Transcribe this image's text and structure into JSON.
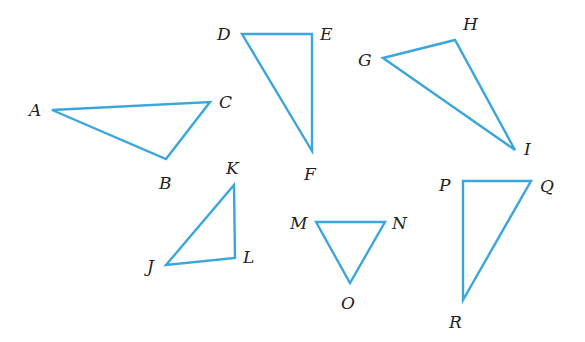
{
  "figure": {
    "width": 585,
    "height": 342,
    "stroke_color": "#3aa6dd",
    "label_color": "#222222",
    "triangles": [
      {
        "name": "ABC",
        "vertices": [
          {
            "label": "A",
            "x": 52,
            "y": 110,
            "lx": 29,
            "ly": 116
          },
          {
            "label": "C",
            "x": 210,
            "y": 102,
            "lx": 219,
            "ly": 108
          },
          {
            "label": "B",
            "x": 166,
            "y": 159,
            "lx": 159,
            "ly": 189
          }
        ]
      },
      {
        "name": "DEF",
        "vertices": [
          {
            "label": "D",
            "x": 242,
            "y": 34,
            "lx": 217,
            "ly": 40
          },
          {
            "label": "E",
            "x": 312,
            "y": 34,
            "lx": 320,
            "ly": 40
          },
          {
            "label": "F",
            "x": 312,
            "y": 151,
            "lx": 304,
            "ly": 180
          }
        ]
      },
      {
        "name": "GHI",
        "vertices": [
          {
            "label": "G",
            "x": 383,
            "y": 58,
            "lx": 358,
            "ly": 66
          },
          {
            "label": "H",
            "x": 455,
            "y": 40,
            "lx": 463,
            "ly": 30
          },
          {
            "label": "I",
            "x": 515,
            "y": 150,
            "lx": 524,
            "ly": 155
          }
        ]
      },
      {
        "name": "JKL",
        "vertices": [
          {
            "label": "K",
            "x": 234,
            "y": 185,
            "lx": 226,
            "ly": 174
          },
          {
            "label": "L",
            "x": 235,
            "y": 258,
            "lx": 243,
            "ly": 263
          },
          {
            "label": "J",
            "x": 166,
            "y": 265,
            "lx": 147,
            "ly": 272
          }
        ]
      },
      {
        "name": "MNO",
        "vertices": [
          {
            "label": "M",
            "x": 316,
            "y": 222,
            "lx": 290,
            "ly": 229
          },
          {
            "label": "N",
            "x": 385,
            "y": 222,
            "lx": 392,
            "ly": 229
          },
          {
            "label": "O",
            "x": 350,
            "y": 283,
            "lx": 341,
            "ly": 309
          }
        ]
      },
      {
        "name": "PQR",
        "vertices": [
          {
            "label": "P",
            "x": 463,
            "y": 181,
            "lx": 439,
            "ly": 191
          },
          {
            "label": "Q",
            "x": 531,
            "y": 181,
            "lx": 540,
            "ly": 192
          },
          {
            "label": "R",
            "x": 463,
            "y": 300,
            "lx": 449,
            "ly": 328
          }
        ]
      }
    ]
  }
}
